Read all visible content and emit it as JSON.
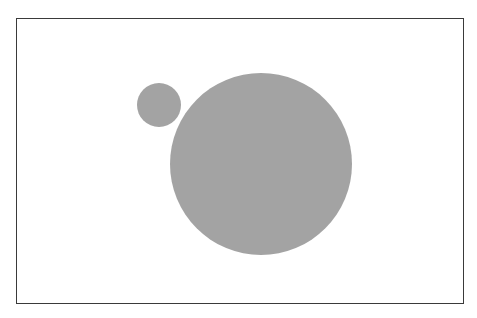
{
  "diagram": {
    "frame": {
      "border_color": "#3a3a3a",
      "background": "#ffffff"
    },
    "shapes": [
      {
        "id": "small-circle",
        "type": "circle",
        "cx": 159,
        "cy": 105,
        "r": 22,
        "fill": "#a3a3a3"
      },
      {
        "id": "large-circle",
        "type": "circle",
        "cx": 261,
        "cy": 164,
        "r": 91,
        "fill": "#a3a3a3"
      }
    ]
  }
}
